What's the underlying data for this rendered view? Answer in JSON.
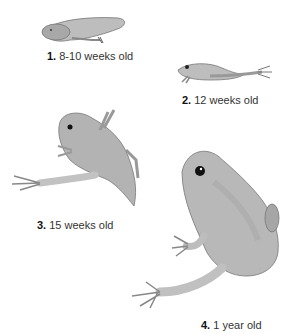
{
  "diagram": {
    "title": "",
    "stages": [
      {
        "number": "1.",
        "label": "8-10 weeks old",
        "depiction": "tadpole with hind legs"
      },
      {
        "number": "2.",
        "label": "12 weeks old",
        "depiction": "froglet with four legs and tail"
      },
      {
        "number": "3.",
        "label": "15 weeks old",
        "depiction": "young frog with shrinking tail"
      },
      {
        "number": "4.",
        "label": "1 year old",
        "depiction": "adult frog"
      }
    ],
    "colors": {
      "body": "#b4b4b4",
      "shade": "#9a9a9a",
      "outline": "#6e6e6e",
      "text": "#333333"
    }
  }
}
